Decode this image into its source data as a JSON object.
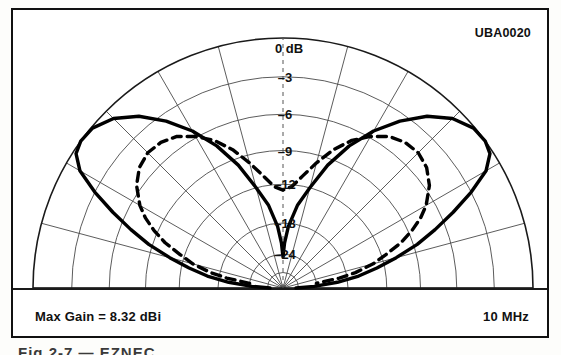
{
  "figure": {
    "corner_tag": "UBA0020",
    "max_gain": "Max Gain = 8.32 dBi",
    "frequency": "10 MHz",
    "caption_fragment": "Fig 2-7 — EZNEC"
  },
  "chart_data": {
    "type": "line",
    "plot_kind": "polar-elevation-radiation-pattern",
    "title": "",
    "xlabel": "",
    "ylabel": "",
    "grid": true,
    "legend_position": "none",
    "angular": {
      "label": "Elevation angle",
      "unit": "degrees",
      "range": [
        0,
        180
      ],
      "spoke_step_deg": 15,
      "spokes_deg": [
        0,
        15,
        30,
        45,
        60,
        75,
        90,
        105,
        120,
        135,
        150,
        165,
        180
      ]
    },
    "radial": {
      "label": "Relative gain",
      "unit": "dB",
      "outer_value": 0,
      "tick_labels": [
        "0 dB",
        "–3",
        "–6",
        "–9",
        "–12",
        "–18",
        "–24"
      ],
      "tick_values": [
        0,
        -3,
        -6,
        -9,
        -12,
        -18,
        -24
      ],
      "tick_radius_frac": [
        1.0,
        0.845,
        0.695,
        0.55,
        0.415,
        0.26,
        0.135
      ],
      "ring_count": 7
    },
    "series": [
      {
        "name": "solid-pattern",
        "style": "solid",
        "color": "#000000",
        "width_px": 3.4,
        "peak_gain_dbi": 8.32,
        "peak_elevation_deg": [
          30,
          150
        ],
        "points_deg_db": [
          [
            0,
            -40
          ],
          [
            3,
            -26
          ],
          [
            6,
            -20
          ],
          [
            9,
            -16.2
          ],
          [
            12,
            -13.2
          ],
          [
            15,
            -10.8
          ],
          [
            18,
            -8.7
          ],
          [
            21,
            -6.9
          ],
          [
            24,
            -5.0
          ],
          [
            27,
            -3.0
          ],
          [
            30,
            -1.2
          ],
          [
            33,
            -0.25
          ],
          [
            36,
            0
          ],
          [
            40,
            -0.1
          ],
          [
            45,
            -0.8
          ],
          [
            50,
            -2.0
          ],
          [
            55,
            -3.6
          ],
          [
            60,
            -5.4
          ],
          [
            65,
            -7.4
          ],
          [
            70,
            -9.6
          ],
          [
            75,
            -12.0
          ],
          [
            80,
            -15.0
          ],
          [
            85,
            -18.6
          ],
          [
            88,
            -21.8
          ],
          [
            90,
            -26
          ],
          [
            92,
            -21.8
          ],
          [
            95,
            -18.6
          ],
          [
            100,
            -15.0
          ],
          [
            105,
            -12.0
          ],
          [
            110,
            -9.6
          ],
          [
            115,
            -7.4
          ],
          [
            120,
            -5.4
          ],
          [
            125,
            -3.6
          ],
          [
            130,
            -2.0
          ],
          [
            135,
            -0.8
          ],
          [
            140,
            -0.1
          ],
          [
            144,
            0
          ],
          [
            147,
            -0.25
          ],
          [
            150,
            -1.2
          ],
          [
            153,
            -3.0
          ],
          [
            156,
            -5.0
          ],
          [
            159,
            -6.9
          ],
          [
            162,
            -8.7
          ],
          [
            165,
            -10.8
          ],
          [
            168,
            -13.2
          ],
          [
            171,
            -16.2
          ],
          [
            174,
            -20
          ],
          [
            177,
            -26
          ],
          [
            180,
            -40
          ]
        ]
      },
      {
        "name": "dashed-pattern",
        "style": "dashed",
        "color": "#000000",
        "width_px": 3.4,
        "dash_pattern": "9 6",
        "points_deg_db": [
          [
            8,
            -24
          ],
          [
            10,
            -19.5
          ],
          [
            12,
            -16.6
          ],
          [
            15,
            -13.6
          ],
          [
            18,
            -11.6
          ],
          [
            21,
            -10.0
          ],
          [
            24,
            -8.7
          ],
          [
            27,
            -7.6
          ],
          [
            30,
            -6.7
          ],
          [
            35,
            -5.6
          ],
          [
            40,
            -4.9
          ],
          [
            45,
            -4.6
          ],
          [
            50,
            -4.7
          ],
          [
            55,
            -5.1
          ],
          [
            60,
            -5.9
          ],
          [
            65,
            -6.9
          ],
          [
            70,
            -8.2
          ],
          [
            75,
            -9.7
          ],
          [
            80,
            -11.1
          ],
          [
            85,
            -12.3
          ],
          [
            90,
            -12.9
          ],
          [
            95,
            -12.3
          ],
          [
            100,
            -11.1
          ],
          [
            105,
            -9.7
          ],
          [
            110,
            -8.2
          ],
          [
            115,
            -6.9
          ],
          [
            120,
            -5.9
          ],
          [
            125,
            -5.1
          ],
          [
            130,
            -4.7
          ],
          [
            135,
            -4.6
          ],
          [
            140,
            -4.9
          ],
          [
            145,
            -5.6
          ],
          [
            150,
            -6.7
          ],
          [
            153,
            -7.6
          ],
          [
            156,
            -8.7
          ],
          [
            159,
            -10.0
          ],
          [
            162,
            -11.6
          ],
          [
            165,
            -13.6
          ],
          [
            168,
            -16.6
          ],
          [
            170,
            -19.5
          ],
          [
            172,
            -24
          ]
        ]
      }
    ],
    "annotations": [
      {
        "name": "corner-tag",
        "text": "UBA0020",
        "position": "top-right"
      },
      {
        "name": "max-gain",
        "text": "Max Gain = 8.32 dBi",
        "position": "bottom-left"
      },
      {
        "name": "frequency",
        "text": "10 MHz",
        "position": "bottom-right"
      }
    ]
  }
}
